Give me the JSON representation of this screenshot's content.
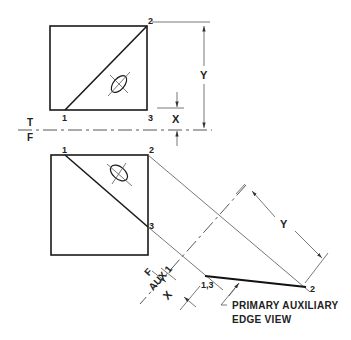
{
  "figure": {
    "points": {
      "top_view": {
        "p1": "1",
        "p2": "2",
        "p3": "3"
      },
      "front_view": {
        "p1": "1",
        "p2": "2",
        "p3": "3"
      },
      "aux_view": {
        "p13": "1,3",
        "p2": "2"
      }
    },
    "dimensions": {
      "y_top": "Y",
      "x_top": "X",
      "y_aux": "Y",
      "x_aux": "X"
    },
    "fold_lines": {
      "tf_upper": "T",
      "tf_lower": "F",
      "aux_upper": "F",
      "aux_lower": "AUX 1"
    },
    "callout": {
      "line1": "PRIMARY AUXILIARY",
      "line2": "EDGE VIEW"
    }
  }
}
